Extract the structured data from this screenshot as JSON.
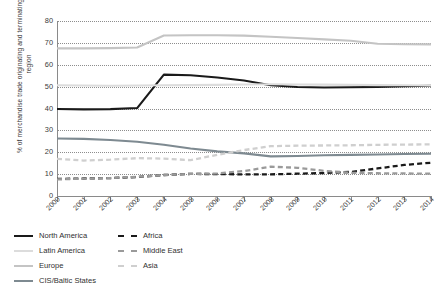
{
  "chart_data": {
    "type": "line",
    "title": "",
    "xlabel": "",
    "ylabel": "% of merchandise trade originating and terminating in each region",
    "ylim": [
      0,
      80
    ],
    "yticks": [
      0,
      10,
      20,
      30,
      40,
      50,
      60,
      70,
      80
    ],
    "grid": true,
    "legend_position": "bottom-left",
    "categories": [
      "2000",
      "2001",
      "2002",
      "2003",
      "2004",
      "2005",
      "2006",
      "2007",
      "2008",
      "2009",
      "2010",
      "2011",
      "2012",
      "2013",
      "2014"
    ],
    "series": [
      {
        "name": "North America",
        "color": "#1a1a1a",
        "style": "solid",
        "values": [
          39.8,
          39.6,
          39.7,
          40.2,
          55.5,
          55.2,
          54.2,
          52.8,
          50.6,
          49.8,
          49.6,
          49.7,
          49.9,
          50.2,
          50.4
        ]
      },
      {
        "name": "Latin America",
        "color": "#dcdcdc",
        "style": "solid",
        "values": [
          50.6,
          50.5,
          50.4,
          50.5,
          50.6,
          50.7,
          50.8,
          51.0,
          51.1,
          51.0,
          50.9,
          50.8,
          50.7,
          50.6,
          50.5
        ]
      },
      {
        "name": "Europe",
        "color": "#c4c4c4",
        "style": "solid",
        "values": [
          67.5,
          67.5,
          67.6,
          67.9,
          73.4,
          73.5,
          73.5,
          73.3,
          72.8,
          72.2,
          71.6,
          71.0,
          69.6,
          69.4,
          69.3
        ]
      },
      {
        "name": "CIS/Baltic States",
        "color": "#7e8a91",
        "style": "solid",
        "values": [
          26.3,
          26.1,
          25.6,
          24.8,
          23.4,
          21.7,
          20.4,
          19.5,
          18.1,
          18.3,
          18.6,
          18.8,
          19.0,
          19.2,
          19.3
        ]
      },
      {
        "name": "Africa",
        "color": "#1a1a1a",
        "style": "dashed",
        "values": [
          7.8,
          8.0,
          8.2,
          8.7,
          9.6,
          10.1,
          10.0,
          9.9,
          9.9,
          10.2,
          10.5,
          11.0,
          12.6,
          14.2,
          15.2
        ]
      },
      {
        "name": "Middle East",
        "color": "#9a9a9a",
        "style": "dashed",
        "values": [
          7.6,
          7.9,
          8.2,
          8.8,
          9.6,
          10.1,
          10.3,
          11.4,
          13.4,
          12.9,
          11.5,
          10.6,
          10.4,
          10.3,
          10.2
        ]
      },
      {
        "name": "Asia",
        "color": "#cfcfcf",
        "style": "dashed",
        "values": [
          17.0,
          16.2,
          16.6,
          17.3,
          17.1,
          16.4,
          18.8,
          21.0,
          22.8,
          23.0,
          23.1,
          23.2,
          23.4,
          23.5,
          23.6
        ]
      }
    ]
  }
}
